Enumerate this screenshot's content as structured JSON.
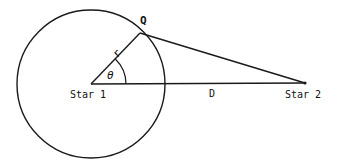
{
  "diagram": {
    "labels": {
      "star1": "Star 1",
      "star2": "Star 2",
      "point_q": "Q",
      "radius": "r",
      "angle": "θ",
      "distance": "D"
    },
    "geometry": {
      "circle_center": [
        91,
        84
      ],
      "circle_radius": 74,
      "point_q": [
        140,
        33
      ],
      "star2": [
        305,
        83
      ]
    },
    "colors": {
      "stroke": "#1a1a1a",
      "background": "#ffffff"
    }
  }
}
